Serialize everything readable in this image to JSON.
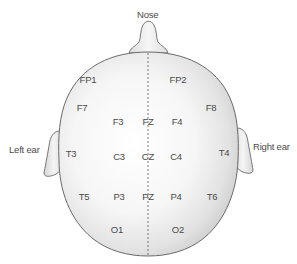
{
  "diagram": {
    "colors": {
      "outline": "#6a6a6a",
      "fill_light": "#ffffff",
      "fill_shade": "#d4d4d4",
      "text": "#4a4a4a",
      "midline": "#6a6a6a"
    },
    "annotations": {
      "nose": "Nose",
      "left_ear": "Left ear",
      "right_ear": "Right ear"
    },
    "electrodes": [
      {
        "id": "FP1",
        "label": "FP1",
        "x": 88,
        "y": 80
      },
      {
        "id": "FP2",
        "label": "FP2",
        "x": 178,
        "y": 80
      },
      {
        "id": "F7",
        "label": "F7",
        "x": 82,
        "y": 108
      },
      {
        "id": "F8",
        "label": "F8",
        "x": 211,
        "y": 108
      },
      {
        "id": "F3",
        "label": "F3",
        "x": 118,
        "y": 122
      },
      {
        "id": "FZ",
        "label": "FZ",
        "x": 148,
        "y": 122
      },
      {
        "id": "F4",
        "label": "F4",
        "x": 177,
        "y": 122
      },
      {
        "id": "T3",
        "label": "T3",
        "x": 71,
        "y": 154
      },
      {
        "id": "C3",
        "label": "C3",
        "x": 119,
        "y": 157
      },
      {
        "id": "CZ",
        "label": "CZ",
        "x": 148,
        "y": 157
      },
      {
        "id": "C4",
        "label": "C4",
        "x": 176,
        "y": 157
      },
      {
        "id": "T4",
        "label": "T4",
        "x": 224,
        "y": 153
      },
      {
        "id": "T5",
        "label": "T5",
        "x": 84,
        "y": 197
      },
      {
        "id": "P3",
        "label": "P3",
        "x": 119,
        "y": 197
      },
      {
        "id": "PZ",
        "label": "PZ",
        "x": 148,
        "y": 197
      },
      {
        "id": "P4",
        "label": "P4",
        "x": 176,
        "y": 197
      },
      {
        "id": "T6",
        "label": "T6",
        "x": 212,
        "y": 197
      },
      {
        "id": "O1",
        "label": "O1",
        "x": 117,
        "y": 230
      },
      {
        "id": "O2",
        "label": "O2",
        "x": 178,
        "y": 230
      }
    ]
  }
}
